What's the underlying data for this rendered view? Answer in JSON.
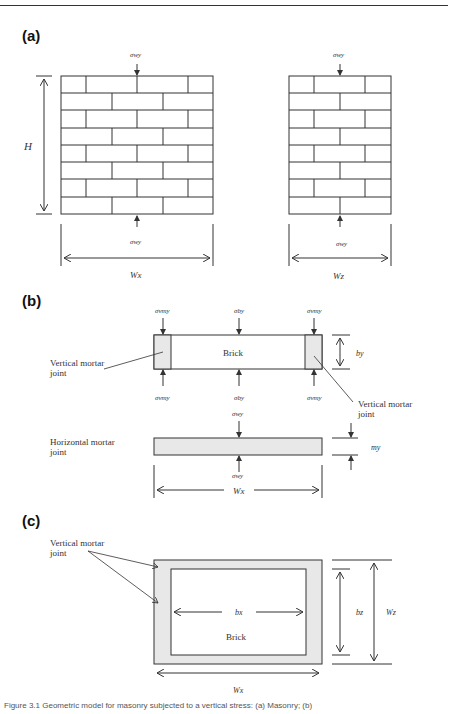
{
  "figure": {
    "caption": "Figure 3.1 Geometric model for masonry subjected to a vertical stress: (a) Masonry; (b)",
    "panels": {
      "a": {
        "label": "(a)",
        "height_label": "H",
        "left_wall": {
          "top_stress": "σwy",
          "bottom_stress": "σwy",
          "width_label": "Wx",
          "courses": 8
        },
        "right_wall": {
          "top_stress": "σwy",
          "bottom_stress": "σwy",
          "width_label": "Wz",
          "courses": 8
        }
      },
      "b": {
        "label": "(b)",
        "brick_label": "Brick",
        "top_stresses": [
          "σvmy",
          "σby",
          "σvmy"
        ],
        "bottom_stresses": [
          "σvmy",
          "σby",
          "σvmy"
        ],
        "brick_height_label": "by",
        "left_joint_callout": "Vertical mortar joint",
        "right_joint_callout": "Vertical mortar joint",
        "horizontal_joint_callout": "Horizontal mortar joint",
        "joint_top_stress": "σwy",
        "joint_bottom_stress": "σwy",
        "joint_height_label": "my",
        "joint_width_label": "Wx"
      },
      "c": {
        "label": "(c)",
        "callout": "Vertical mortar joint",
        "brick_label": "Brick",
        "inner_width_label": "bx",
        "inner_depth_label": "bz",
        "outer_depth_label": "Wz",
        "outer_width_label": "Wx"
      }
    },
    "colors": {
      "line": "#333333",
      "mortar_fill": "#e8e8e8",
      "background": "#ffffff"
    }
  }
}
